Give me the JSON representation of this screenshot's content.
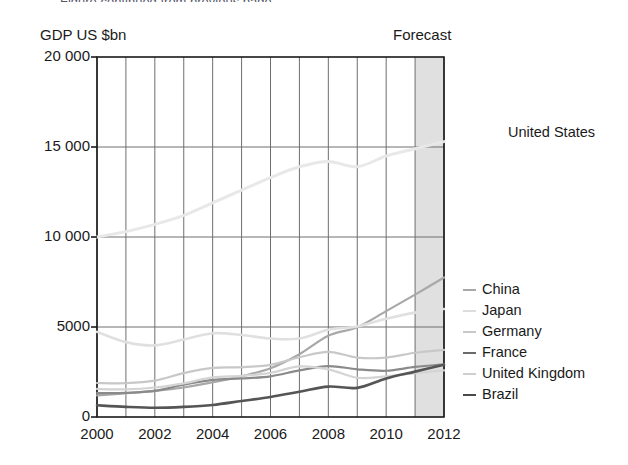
{
  "figure": {
    "clipped_top_text": "Figure continued from previous page",
    "y_axis_title": "GDP US $bn",
    "forecast_label": "Forecast"
  },
  "chart_data": {
    "type": "line",
    "title": "",
    "xlabel": "",
    "ylabel": "GDP US $bn",
    "xlim": [
      2000,
      2012
    ],
    "ylim": [
      0,
      20000
    ],
    "grid": true,
    "legend_position": "right",
    "x": [
      2000,
      2001,
      2002,
      2003,
      2004,
      2005,
      2006,
      2007,
      2008,
      2009,
      2010,
      2011,
      2012
    ],
    "x_ticks": [
      "2000",
      "2002",
      "2004",
      "2006",
      "2008",
      "2010",
      "2012"
    ],
    "y_ticks": [
      "0",
      "5000",
      "10 000",
      "15 000",
      "20 000"
    ],
    "y_tick_values": [
      0,
      5000,
      10000,
      15000,
      20000
    ],
    "forecast_start": 2011,
    "forecast_end": 2012,
    "series": [
      {
        "name": "United States",
        "color": "#e8e8e8",
        "width": 3,
        "values": [
          10000,
          10300,
          10700,
          11200,
          11900,
          12600,
          13300,
          13900,
          14200,
          13900,
          14500,
          14900,
          15300
        ]
      },
      {
        "name": "China",
        "color": "#a8a8a8",
        "width": 2.2,
        "values": [
          1200,
          1320,
          1450,
          1640,
          1930,
          2260,
          2710,
          3490,
          4520,
          4990,
          5880,
          6800,
          7750
        ]
      },
      {
        "name": "Japan",
        "color": "#e0e0e0",
        "width": 2.6,
        "values": [
          4730,
          4160,
          3980,
          4300,
          4650,
          4560,
          4360,
          4360,
          4850,
          5030,
          5460,
          5800,
          6000
        ]
      },
      {
        "name": "Germany",
        "color": "#c8c8c8",
        "width": 2.2,
        "values": [
          1890,
          1880,
          2020,
          2440,
          2730,
          2770,
          2900,
          3320,
          3620,
          3300,
          3300,
          3570,
          3730
        ]
      },
      {
        "name": "France",
        "color": "#8a8a8a",
        "width": 2.2,
        "values": [
          1330,
          1340,
          1450,
          1800,
          2060,
          2140,
          2260,
          2590,
          2830,
          2650,
          2570,
          2780,
          2930
        ]
      },
      {
        "name": "United Kingdom",
        "color": "#d4d4d4",
        "width": 2.2,
        "values": [
          1560,
          1540,
          1640,
          1870,
          2200,
          2290,
          2450,
          2810,
          2650,
          2180,
          2260,
          2430,
          2590
        ]
      },
      {
        "name": "Brazil",
        "color": "#555555",
        "width": 2.6,
        "values": [
          650,
          560,
          510,
          560,
          670,
          890,
          1110,
          1400,
          1690,
          1620,
          2140,
          2520,
          2900
        ]
      }
    ]
  },
  "legend": {
    "top_entry": {
      "label": "United States",
      "color": "#e8e8e8"
    },
    "entries": [
      {
        "label": "China",
        "color": "#a8a8a8"
      },
      {
        "label": "Japan",
        "color": "#dcdcdc"
      },
      {
        "label": "Germany",
        "color": "#c8c8c8"
      },
      {
        "label": "France",
        "color": "#6a6a6a"
      },
      {
        "label": "United Kingdom",
        "color": "#cfcfcf"
      },
      {
        "label": "Brazil",
        "color": "#4a4a4a"
      }
    ]
  },
  "colors": {
    "axis": "#1a1a1a",
    "grid": "#6e6e6e",
    "forecast_band": "#d6d6d6",
    "background": "#ffffff"
  }
}
